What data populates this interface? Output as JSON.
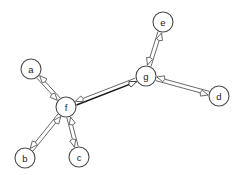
{
  "diagram": {
    "width": 239,
    "height": 175,
    "background_color": "#ffffff",
    "node_fill_color": "#ffffff",
    "node_stroke_color": "#4a4a4c",
    "edge_color": "#58585a",
    "highlight_edge_color": "#1a1a1a",
    "label_color": "#1d1d1d",
    "node_radius": 10
  },
  "nodes": [
    {
      "id": "a",
      "label": "a",
      "x": 31,
      "y": 69
    },
    {
      "id": "b",
      "label": "b",
      "x": 25,
      "y": 158
    },
    {
      "id": "c",
      "label": "c",
      "x": 79,
      "y": 157
    },
    {
      "id": "d",
      "label": "d",
      "x": 219,
      "y": 96
    },
    {
      "id": "e",
      "label": "e",
      "x": 163,
      "y": 22
    },
    {
      "id": "f",
      "label": "f",
      "x": 66,
      "y": 107
    },
    {
      "id": "g",
      "label": "g",
      "x": 146,
      "y": 76
    }
  ],
  "edges": [
    {
      "id": "edge-a-f",
      "source": "a",
      "target": "f",
      "bidirectional": true,
      "emphasis": "normal"
    },
    {
      "id": "edge-b-f",
      "source": "b",
      "target": "f",
      "bidirectional": true,
      "emphasis": "normal"
    },
    {
      "id": "edge-c-f",
      "source": "c",
      "target": "f",
      "bidirectional": true,
      "emphasis": "normal"
    },
    {
      "id": "edge-f-g",
      "source": "f",
      "target": "g",
      "bidirectional": true,
      "emphasis": "heavy"
    },
    {
      "id": "edge-g-e",
      "source": "g",
      "target": "e",
      "bidirectional": true,
      "emphasis": "normal"
    },
    {
      "id": "edge-g-d",
      "source": "g",
      "target": "d",
      "bidirectional": true,
      "emphasis": "normal"
    }
  ]
}
